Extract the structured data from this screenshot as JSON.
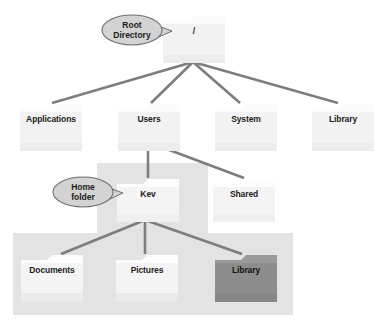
{
  "diagram": {
    "kind": "tree-diagram",
    "colors": {
      "page_background": "#ffffff",
      "folder_light": "#f2f2f2",
      "folder_tab": "#fbfbfb",
      "folder_dark": "#8d8d8d",
      "backdrop_gray": "#e2e2e2",
      "edge_line": "#7d7d7d",
      "callout_fill": "#d3d3d3",
      "callout_stroke": "#6e6e6e",
      "label_text": "#1c1c1c"
    },
    "nodes": [
      {
        "id": "root",
        "label": "/",
        "level": 0,
        "style": "light"
      },
      {
        "id": "applications",
        "label": "Applications",
        "level": 1,
        "style": "light"
      },
      {
        "id": "users",
        "label": "Users",
        "level": 1,
        "style": "light"
      },
      {
        "id": "system",
        "label": "System",
        "level": 1,
        "style": "light"
      },
      {
        "id": "library",
        "label": "Library",
        "level": 1,
        "style": "light"
      },
      {
        "id": "kev",
        "label": "Kev",
        "level": 2,
        "style": "light"
      },
      {
        "id": "shared",
        "label": "Shared",
        "level": 2,
        "style": "light"
      },
      {
        "id": "documents",
        "label": "Documents",
        "level": 3,
        "style": "light"
      },
      {
        "id": "pictures",
        "label": "Pictures",
        "level": 3,
        "style": "light"
      },
      {
        "id": "userlibrary",
        "label": "Library",
        "level": 3,
        "style": "dark"
      }
    ],
    "edges": [
      {
        "from": "root",
        "to": "applications"
      },
      {
        "from": "root",
        "to": "users"
      },
      {
        "from": "root",
        "to": "system"
      },
      {
        "from": "root",
        "to": "library"
      },
      {
        "from": "users",
        "to": "kev"
      },
      {
        "from": "users",
        "to": "shared"
      },
      {
        "from": "kev",
        "to": "documents"
      },
      {
        "from": "kev",
        "to": "pictures"
      },
      {
        "from": "kev",
        "to": "userlibrary"
      }
    ],
    "callouts": [
      {
        "id": "root-callout",
        "line1": "Root",
        "line2": "Directory",
        "points_to": "root"
      },
      {
        "id": "home-callout",
        "line1": "Home",
        "line2": "folder",
        "points_to": "kev"
      }
    ]
  }
}
